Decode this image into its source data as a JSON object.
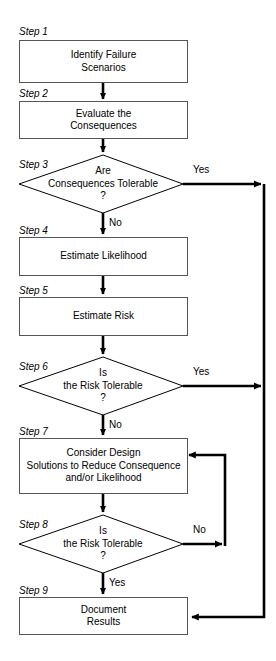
{
  "diagram": {
    "type": "flowchart",
    "background_color": "#ffffff",
    "line_color": "#000000",
    "box_border_color": "#555555",
    "text_color": "#000000"
  },
  "steps": [
    {
      "id": "step1",
      "label": "Step 1",
      "shape": "process",
      "text": "Identify Failure\nScenarios"
    },
    {
      "id": "step2",
      "label": "Step 2",
      "shape": "process",
      "text": "Evaluate the\nConsequences"
    },
    {
      "id": "step3",
      "label": "Step 3",
      "shape": "decision",
      "text": "Are\nConsequences Tolerable\n?"
    },
    {
      "id": "step4",
      "label": "Step 4",
      "shape": "process",
      "text": "Estimate Likelihood"
    },
    {
      "id": "step5",
      "label": "Step 5",
      "shape": "process",
      "text": "Estimate Risk"
    },
    {
      "id": "step6",
      "label": "Step 6",
      "shape": "decision",
      "text": "Is\nthe Risk Tolerable\n?"
    },
    {
      "id": "step7",
      "label": "Step 7",
      "shape": "process",
      "text": "Consider Design\nSolutions to Reduce Consequence\nand/or Likelihood"
    },
    {
      "id": "step8",
      "label": "Step 8",
      "shape": "decision",
      "text": "Is\nthe Risk Tolerable\n?"
    },
    {
      "id": "step9",
      "label": "Step 9",
      "shape": "process",
      "text": "Document\nResults"
    }
  ],
  "edge_labels": {
    "step3_yes": "Yes",
    "step3_no": "No",
    "step6_yes": "Yes",
    "step6_no": "No",
    "step8_no": "No",
    "step8_yes": "Yes"
  }
}
